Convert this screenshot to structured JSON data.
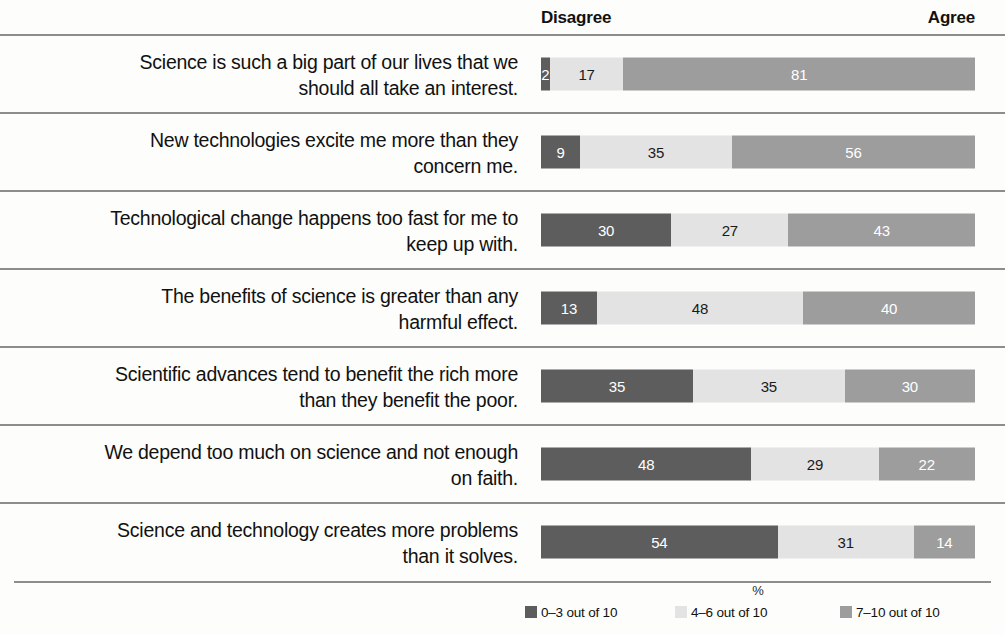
{
  "header": {
    "disagree_label": "Disagree",
    "agree_label": "Agree"
  },
  "axis": {
    "unit_label": "%"
  },
  "legend": {
    "items": [
      {
        "label": "0–3 out of 10",
        "swatch": "legend-swatch-low",
        "color": "#5d5d5d"
      },
      {
        "label": "4–6 out of 10",
        "swatch": "legend-swatch-mid",
        "color": "#e3e3e3"
      },
      {
        "label": "7–10 out of 10",
        "swatch": "legend-swatch-high",
        "color": "#9d9d9d"
      }
    ]
  },
  "rows": [
    {
      "label_line1": "Science is such a big part of our lives that we",
      "label_line2": "should all take an interest.",
      "values": [
        2,
        17,
        81
      ]
    },
    {
      "label_line1": "New technologies excite me more than they",
      "label_line2": "concern me.",
      "values": [
        9,
        35,
        56
      ]
    },
    {
      "label_line1": "Technological change happens too fast for me to",
      "label_line2": "keep up with.",
      "values": [
        30,
        27,
        43
      ]
    },
    {
      "label_line1": "The benefits of science is greater than any",
      "label_line2": "harmful effect.",
      "values": [
        13,
        48,
        40
      ]
    },
    {
      "label_line1": "Scientific advances tend to benefit the rich more",
      "label_line2": "than they benefit the poor.",
      "values": [
        35,
        35,
        30
      ]
    },
    {
      "label_line1": "We depend too much on science and not enough",
      "label_line2": "on faith.",
      "values": [
        48,
        29,
        22
      ]
    },
    {
      "label_line1": "Science and technology creates more problems",
      "label_line2": "than it solves.",
      "values": [
        54,
        31,
        14
      ]
    }
  ],
  "chart_data": {
    "type": "bar",
    "title": "",
    "subtitle": "",
    "orientation": "horizontal",
    "stacked": true,
    "normalized": true,
    "xlabel": "%",
    "ylabel": "",
    "xlim": [
      0,
      100
    ],
    "grid": false,
    "legend_position": "bottom-right",
    "annotations": [
      "Disagree",
      "Agree"
    ],
    "categories": [
      "Science is such a big part of our lives that we should all take an interest.",
      "New technologies excite me more than they concern me.",
      "Technological change happens too fast for me to keep up with.",
      "The benefits of science is greater than any harmful effect.",
      "Scientific advances tend to benefit the rich more than they benefit the poor.",
      "We depend too much on science and not enough on faith.",
      "Science and technology creates more problems than it solves."
    ],
    "series": [
      {
        "name": "0–3 out of 10",
        "color": "#5d5d5d",
        "values": [
          2,
          9,
          30,
          13,
          35,
          48,
          54
        ]
      },
      {
        "name": "4–6 out of 10",
        "color": "#e3e3e3",
        "values": [
          17,
          35,
          27,
          48,
          35,
          29,
          31
        ]
      },
      {
        "name": "7–10 out of 10",
        "color": "#9d9d9d",
        "values": [
          81,
          56,
          43,
          40,
          30,
          22,
          14
        ]
      }
    ]
  }
}
